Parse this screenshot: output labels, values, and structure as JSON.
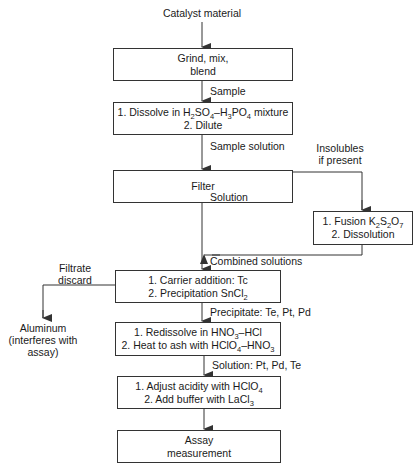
{
  "diagram": {
    "start_label": "Catalyst material",
    "boxes": {
      "grind": [
        "Grind, mix,",
        "blend"
      ],
      "dissolve": [
        "1. Dissolve in H<sub>2</sub>SO<sub>4</sub>–H<sub>3</sub>PO<sub>4</sub> mixture",
        "2. Dilute"
      ],
      "filter": [
        "Filter"
      ],
      "fusion": [
        "1. Fusion K<sub>2</sub>S<sub>2</sub>O<sub>7</sub>",
        "2. Dissolution"
      ],
      "carrier": [
        "1. Carrier addition: Tc",
        "2. Precipitation SnCl<sub>2</sub>"
      ],
      "redissolve": [
        "1. Redissolve in HNO<sub>3</sub>–HCl",
        "2. Heat to ash with HClO<sub>4</sub>–HNO<sub>3</sub>"
      ],
      "adjust": [
        "1. Adjust acidity with HClO<sub>4</sub>",
        "2. Add buffer with LaCl<sub>3</sub>"
      ],
      "assay": [
        "Assay",
        "measurement"
      ]
    },
    "edge_labels": {
      "sample": "Sample",
      "sample_solution": "Sample solution",
      "insolubles": [
        "Insolubles",
        "if present"
      ],
      "solution": "Solution",
      "combined": "Combined solutions",
      "filtrate": [
        "Filtrate",
        "discard"
      ],
      "precipitate": "Precipitate: Te, Pt, Pd",
      "solution_pt": "Solution: Pt, Pd, Te"
    },
    "end_side": [
      "Aluminum",
      "(interferes with",
      "assay)"
    ],
    "colors": {
      "line": "#333333",
      "text": "#1a1a1a",
      "background": "#ffffff"
    }
  }
}
